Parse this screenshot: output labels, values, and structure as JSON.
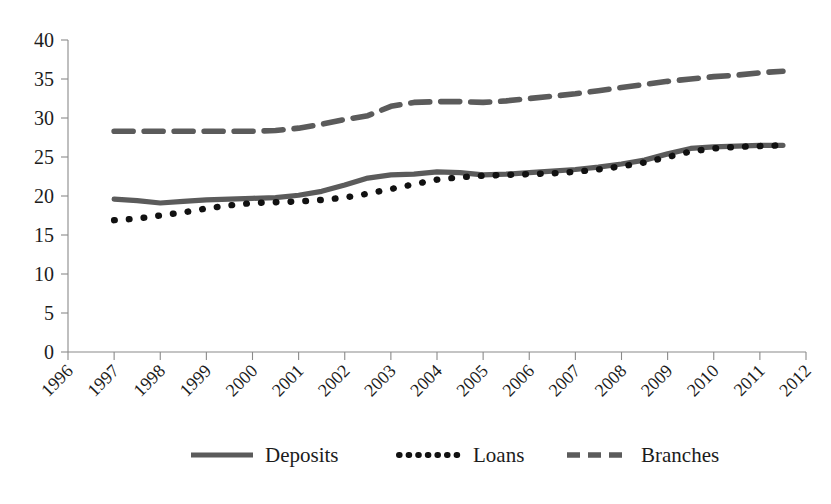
{
  "chart_data": {
    "type": "line",
    "title": "",
    "subtitle": "",
    "xlabel": "",
    "ylabel": "",
    "xlim": [
      1996,
      2012
    ],
    "ylim": [
      0,
      40
    ],
    "ytick_step": 5,
    "grid": false,
    "legend_position": "bottom",
    "xticks": [
      "1996",
      "1997",
      "1998",
      "1999",
      "2000",
      "2001",
      "2002",
      "2003",
      "2004",
      "2005",
      "2006",
      "2007",
      "2008",
      "2009",
      "2010",
      "2011",
      "2012"
    ],
    "yticks": [
      "0",
      "5",
      "10",
      "15",
      "20",
      "25",
      "30",
      "35",
      "40"
    ],
    "x": [
      1997.0,
      1997.5,
      1998.0,
      1998.5,
      1999.0,
      1999.5,
      2000.0,
      2000.5,
      2001.0,
      2001.5,
      2002.0,
      2002.5,
      2003.0,
      2003.5,
      2004.0,
      2004.5,
      2005.0,
      2005.5,
      2006.0,
      2006.5,
      2007.0,
      2007.5,
      2008.0,
      2008.5,
      2009.0,
      2009.5,
      2010.0,
      2010.5,
      2011.0,
      2011.5
    ],
    "series": [
      {
        "name": "Deposits",
        "style": "solid",
        "color": "#5b5b5b",
        "values": [
          19.6,
          19.4,
          19.1,
          19.3,
          19.5,
          19.6,
          19.7,
          19.8,
          20.1,
          20.6,
          21.4,
          22.3,
          22.7,
          22.8,
          23.1,
          23.0,
          22.7,
          22.8,
          23.0,
          23.2,
          23.4,
          23.7,
          24.1,
          24.6,
          25.4,
          26.1,
          26.3,
          26.4,
          26.5,
          26.5
        ]
      },
      {
        "name": "Loans",
        "style": "dotted",
        "color": "#111111",
        "values": [
          16.9,
          17.1,
          17.5,
          17.9,
          18.4,
          18.8,
          19.1,
          19.2,
          19.3,
          19.5,
          19.8,
          20.3,
          20.9,
          21.5,
          22.1,
          22.4,
          22.6,
          22.7,
          22.8,
          22.9,
          23.1,
          23.4,
          23.8,
          24.3,
          25.0,
          25.7,
          26.1,
          26.3,
          26.4,
          26.5
        ]
      },
      {
        "name": "Branches",
        "style": "dashed",
        "color": "#5b5b5b",
        "values": [
          28.3,
          28.3,
          28.3,
          28.3,
          28.3,
          28.3,
          28.3,
          28.4,
          28.7,
          29.2,
          29.8,
          30.3,
          31.5,
          32.0,
          32.1,
          32.1,
          32.0,
          32.2,
          32.5,
          32.8,
          33.1,
          33.5,
          33.9,
          34.3,
          34.7,
          35.0,
          35.3,
          35.5,
          35.8,
          36.0
        ]
      }
    ],
    "legend": [
      {
        "label": "Deposits",
        "style": "solid"
      },
      {
        "label": "Loans",
        "style": "dotted"
      },
      {
        "label": "Branches",
        "style": "dashed"
      }
    ]
  }
}
